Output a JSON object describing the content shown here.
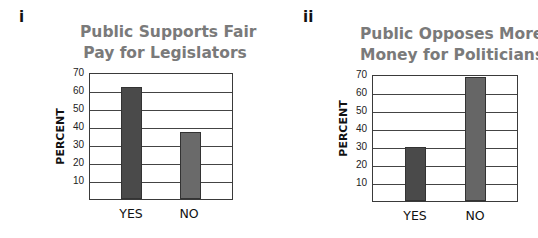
{
  "chart_data": [
    {
      "panel": "i",
      "type": "bar",
      "title": "Public Supports Fair Pay for Legislators",
      "title_lines": [
        "Public Supports Fair",
        "Pay for Legislators"
      ],
      "xlabel": "",
      "ylabel": "PERCENT",
      "categories": [
        "YES",
        "NO"
      ],
      "values": [
        62,
        37
      ],
      "yticks": [
        10,
        20,
        30,
        40,
        50,
        60,
        70
      ],
      "ylim": [
        0,
        70
      ],
      "grid": true,
      "legend": null,
      "colors": [
        "#4a4a4a",
        "#6a6a6a"
      ]
    },
    {
      "panel": "ii",
      "type": "bar",
      "title": "Public Opposes More Money for Politicians",
      "title_lines": [
        "Public Opposes More",
        "Money for Politicians"
      ],
      "xlabel": "",
      "ylabel": "PERCENT",
      "categories": [
        "YES",
        "NO"
      ],
      "values": [
        30,
        69
      ],
      "yticks": [
        10,
        20,
        30,
        40,
        50,
        60,
        70
      ],
      "ylim": [
        0,
        70
      ],
      "grid": true,
      "legend": null,
      "colors": [
        "#4a4a4a",
        "#666666"
      ]
    }
  ]
}
